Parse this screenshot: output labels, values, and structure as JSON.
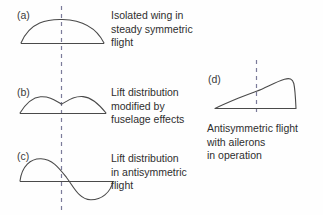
{
  "figure": {
    "background_color": "#fefefe",
    "line_color": "#444444",
    "dashed_line_color": "#7b7b9a",
    "panels": [
      {
        "label": "(a)",
        "caption": "Isolated wing in\nsteady symmetric\nflight",
        "curve_type": "symmetric-elliptical",
        "baseline_y": 43,
        "peak_y": 21,
        "span_x": [
          21,
          104
        ],
        "centerline_x": 61
      },
      {
        "label": "(b)",
        "caption": "Lift distribution\nmodified by\nfuselage effects",
        "curve_type": "double-hump-with-central-dip",
        "baseline_y": 113,
        "peak_y": 97,
        "dip_y": 104,
        "span_x": [
          20,
          105
        ],
        "centerline_x": 61
      },
      {
        "label": "(c)",
        "caption": "Lift distribution\nin antisymmetric\nflight",
        "curve_type": "antisymmetric-sine",
        "baseline_y": 181,
        "positive_peak_y": 160,
        "negative_trough_y": 200,
        "span_x": [
          20,
          112
        ],
        "centerline_x": 61
      },
      {
        "label": "(d)",
        "caption": "Antisymmetric flight\nwith ailerons\nin operation",
        "curve_type": "asymmetric-rising-with-trailing-drop",
        "baseline_y": 108,
        "peak_y": 78,
        "span_x": [
          215,
          296
        ],
        "centerline_x": 256
      }
    ],
    "icons": {
      "centerline": "dashed-vertical-centerline"
    }
  }
}
